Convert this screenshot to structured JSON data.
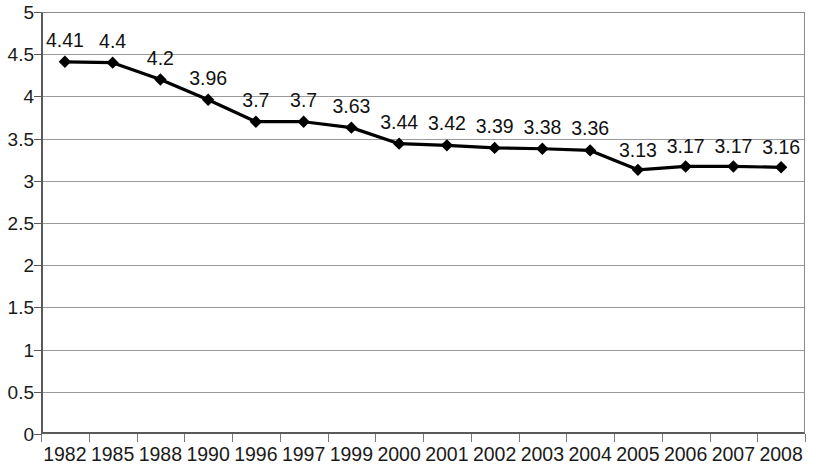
{
  "chart_data": {
    "type": "line",
    "title": "",
    "subtitle": "",
    "xlabel": "",
    "ylabel": "",
    "categories": [
      "1982",
      "1985",
      "1988",
      "1990",
      "1996",
      "1997",
      "1999",
      "2000",
      "2001",
      "2002",
      "2003",
      "2004",
      "2005",
      "2006",
      "2007",
      "2008"
    ],
    "values": [
      4.41,
      4.4,
      4.2,
      3.96,
      3.7,
      3.7,
      3.63,
      3.44,
      3.42,
      3.39,
      3.38,
      3.36,
      3.13,
      3.17,
      3.17,
      3.16
    ],
    "point_labels": [
      "4.41",
      "4.4",
      "4.2",
      "3.96",
      "3.7",
      "3.7",
      "3.63",
      "3.44",
      "3.42",
      "3.39",
      "3.38",
      "3.36",
      "3.13",
      "3.17",
      "3.17",
      "3.16"
    ],
    "ylim": [
      0,
      5
    ],
    "ytick_values": [
      0,
      0.5,
      1,
      1.5,
      2,
      2.5,
      3,
      3.5,
      4,
      4.5,
      5
    ],
    "ytick_labels": [
      "0",
      "0.5",
      "1",
      "1.5",
      "2",
      "2.5",
      "3",
      "3.5",
      "4",
      "4.5",
      "5"
    ],
    "grid": true,
    "grid_axis": "y",
    "legend": false,
    "legend_position": "none",
    "series": [
      {
        "name": "",
        "values": [
          4.41,
          4.4,
          4.2,
          3.96,
          3.7,
          3.7,
          3.63,
          3.44,
          3.42,
          3.39,
          3.38,
          3.36,
          3.13,
          3.17,
          3.17,
          3.16
        ],
        "marker": "diamond",
        "color": "#000000"
      }
    ],
    "colors": {
      "line": "#000000",
      "marker": "#000000",
      "gridline": "#9a9a9a",
      "axis": "#5a5a5a",
      "text": "#1a1a1a",
      "background": "#ffffff"
    }
  }
}
